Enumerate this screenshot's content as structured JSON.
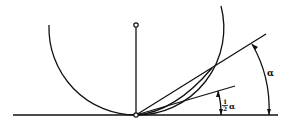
{
  "diagram": {
    "type": "geometry",
    "labels": {
      "alpha": "α",
      "half_alpha_num": "1",
      "half_alpha_den": "2",
      "half_alpha_sym": "α"
    },
    "colors": {
      "stroke": "#111111",
      "background": "#ffffff"
    }
  }
}
